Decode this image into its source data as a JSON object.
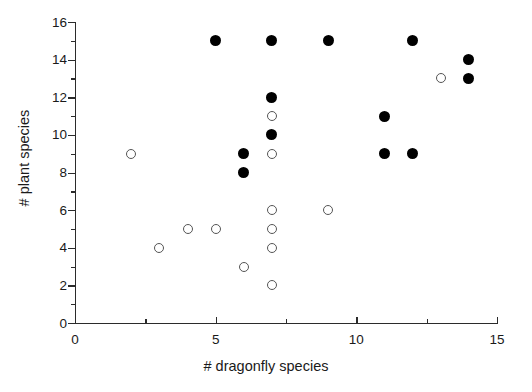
{
  "chart_data": {
    "type": "scatter",
    "title": "",
    "xlabel": "# dragonfly species",
    "ylabel": "# plant species",
    "xlim": [
      0,
      15
    ],
    "ylim": [
      0,
      16
    ],
    "grid": false,
    "legend": "none",
    "x_major_ticks": [
      0,
      5,
      10,
      15
    ],
    "x_major_tick_labels": [
      "0",
      "5",
      "10",
      "15"
    ],
    "x_minor_ticks": [
      2.5,
      7.5,
      12.5
    ],
    "y_major_ticks": [
      0,
      2,
      4,
      6,
      8,
      10,
      12,
      14,
      16
    ],
    "y_major_tick_labels": [
      "0",
      "2",
      "4",
      "6",
      "8",
      "10",
      "12",
      "14",
      "16"
    ],
    "y_minor_ticks": [
      1,
      3,
      5,
      7,
      9,
      11,
      13,
      15
    ],
    "series": [
      {
        "name": "filled",
        "marker": "filled-circle",
        "color": "#000000",
        "points": [
          [
            5,
            15
          ],
          [
            6,
            9
          ],
          [
            6,
            8
          ],
          [
            7,
            15
          ],
          [
            7,
            12
          ],
          [
            7,
            10
          ],
          [
            9,
            15
          ],
          [
            11,
            11
          ],
          [
            11,
            9
          ],
          [
            12,
            15
          ],
          [
            12,
            9
          ],
          [
            14,
            14
          ],
          [
            14,
            13
          ]
        ]
      },
      {
        "name": "open",
        "marker": "open-circle",
        "color": "#555555",
        "points": [
          [
            2,
            9
          ],
          [
            3,
            4
          ],
          [
            4,
            5
          ],
          [
            5,
            5
          ],
          [
            6,
            3
          ],
          [
            7,
            11
          ],
          [
            7,
            9
          ],
          [
            7,
            6
          ],
          [
            7,
            5
          ],
          [
            7,
            4
          ],
          [
            7,
            2
          ],
          [
            9,
            6
          ],
          [
            13,
            13
          ]
        ]
      }
    ]
  }
}
